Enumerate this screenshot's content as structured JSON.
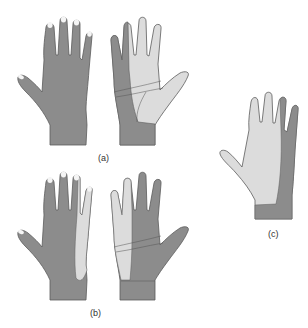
{
  "figure": {
    "panels": [
      {
        "id": "a",
        "label": "(a)",
        "views": [
          "dorsal",
          "palmar"
        ]
      },
      {
        "id": "b",
        "label": "(b)",
        "views": [
          "dorsal",
          "palmar"
        ]
      },
      {
        "id": "c",
        "label": "(c)",
        "views": [
          "palmar"
        ]
      }
    ],
    "colors": {
      "dark_zone": "#8c8c8c",
      "light_zone": "#dcdcdc",
      "outline": "#5a5a5a",
      "nail": "#f4f4f4"
    }
  }
}
